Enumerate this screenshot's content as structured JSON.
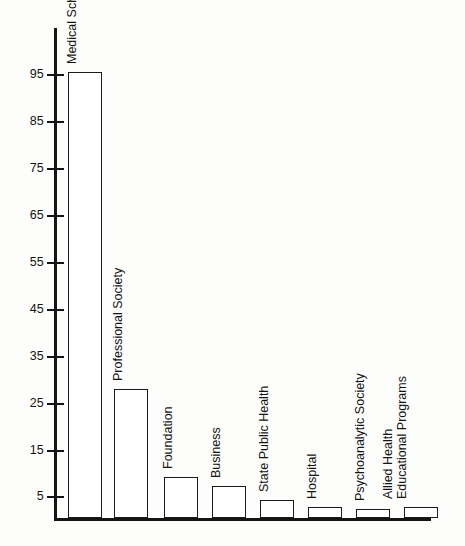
{
  "chart_data": {
    "type": "bar",
    "title": "",
    "subtitle": "",
    "xlabel": "",
    "ylabel": "",
    "categories": [
      "Medical School",
      "Professional Society",
      "Foundation",
      "Business",
      "State Public Health",
      "Hospital",
      "Psychoanalytic Society",
      "Allied Health Educational Programs"
    ],
    "values": [
      97,
      28,
      9,
      7,
      4,
      2.5,
      2,
      2.5
    ],
    "ylim": [
      0,
      105
    ],
    "yticks": [
      5,
      15,
      25,
      35,
      45,
      55,
      65,
      75,
      85,
      95
    ],
    "ytick_labels": [
      "5",
      "15",
      "25",
      "35",
      "45",
      "55",
      "65",
      "75",
      "85",
      "95"
    ],
    "grid": false,
    "legend": false,
    "legend_position": "none",
    "bar_label_rotation": -90,
    "bars": [
      {
        "label": "Medical School",
        "label_lines": [
          "Medical School"
        ],
        "value": 97
      },
      {
        "label": "Professional Society",
        "label_lines": [
          "Professional Society"
        ],
        "value": 28
      },
      {
        "label": "Foundation",
        "label_lines": [
          "Foundation"
        ],
        "value": 9
      },
      {
        "label": "Business",
        "label_lines": [
          "Business"
        ],
        "value": 7
      },
      {
        "label": "State Public Health",
        "label_lines": [
          "State Public Health"
        ],
        "value": 4
      },
      {
        "label": "Hospital",
        "label_lines": [
          "Hospital"
        ],
        "value": 2.5
      },
      {
        "label": "Psychoanalytic Society",
        "label_lines": [
          "Psychoanalytic Society"
        ],
        "value": 2
      },
      {
        "label": "Allied Health Educational Programs",
        "label_lines": [
          "Allied Health",
          "Educational Programs"
        ],
        "value": 2.5
      }
    ]
  },
  "colors": {
    "background": "#fdfdfb",
    "axis": "#151515",
    "bar_outline": "#1b1b1b",
    "bar_fill": "#ffffff",
    "text": "#141414"
  },
  "axis": {
    "ticks": [
      {
        "label": "95"
      },
      {
        "label": "85"
      },
      {
        "label": "75"
      },
      {
        "label": "65"
      },
      {
        "label": "55"
      },
      {
        "label": "45"
      },
      {
        "label": "35"
      },
      {
        "label": "25"
      },
      {
        "label": "15"
      },
      {
        "label": "5"
      }
    ]
  },
  "labels": {
    "bar_0": "Medical School",
    "bar_1": "Professional Society",
    "bar_2": "Foundation",
    "bar_3": "Business",
    "bar_4": "State Public Health",
    "bar_5": "Hospital",
    "bar_6": "Psychoanalytic Society",
    "bar_7_line1": "Allied Health",
    "bar_7_line2": "Educational Programs"
  }
}
